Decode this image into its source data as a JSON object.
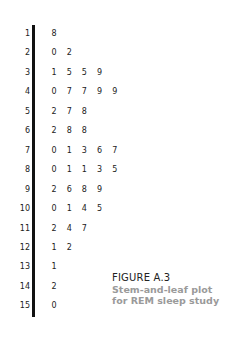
{
  "chart_data": {
    "type": "table",
    "subtype": "stem-and-leaf",
    "title": "FIGURE A.3",
    "subtitle": "Stem-and-leaf plot for REM sleep study",
    "rows": [
      {
        "stem": "1",
        "leaves": [
          "8"
        ]
      },
      {
        "stem": "2",
        "leaves": [
          "0",
          "2"
        ]
      },
      {
        "stem": "3",
        "leaves": [
          "1",
          "5",
          "5",
          "9"
        ]
      },
      {
        "stem": "4",
        "leaves": [
          "0",
          "7",
          "7",
          "9",
          "9"
        ]
      },
      {
        "stem": "5",
        "leaves": [
          "2",
          "7",
          "8"
        ]
      },
      {
        "stem": "6",
        "leaves": [
          "2",
          "8",
          "8"
        ]
      },
      {
        "stem": "7",
        "leaves": [
          "0",
          "1",
          "3",
          "6",
          "7"
        ]
      },
      {
        "stem": "8",
        "leaves": [
          "0",
          "1",
          "1",
          "3",
          "5"
        ]
      },
      {
        "stem": "9",
        "leaves": [
          "2",
          "6",
          "8",
          "9"
        ]
      },
      {
        "stem": "10",
        "leaves": [
          "0",
          "1",
          "4",
          "5"
        ]
      },
      {
        "stem": "11",
        "leaves": [
          "2",
          "4",
          "7"
        ]
      },
      {
        "stem": "12",
        "leaves": [
          "1",
          "2"
        ]
      },
      {
        "stem": "13",
        "leaves": [
          "1"
        ]
      },
      {
        "stem": "14",
        "leaves": [
          "2"
        ]
      },
      {
        "stem": "15",
        "leaves": [
          "0"
        ]
      }
    ]
  },
  "caption": {
    "title": "FIGURE A.3",
    "line1": "Stem-and-leaf plot",
    "line2": "for REM sleep study"
  },
  "colors": {
    "text": "#222222",
    "caption_sub": "#9a9a9a",
    "bar": "#111111"
  }
}
